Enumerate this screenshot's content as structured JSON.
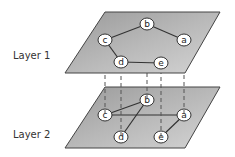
{
  "layers": [
    {
      "label": "Layer 1",
      "nodes": [
        {
          "id": "a",
          "label": "a",
          "x": 184,
          "y": 40
        },
        {
          "id": "b",
          "label": "b",
          "x": 147,
          "y": 24
        },
        {
          "id": "c",
          "label": "c",
          "x": 105,
          "y": 40
        },
        {
          "id": "d",
          "label": "d",
          "x": 121,
          "y": 62
        },
        {
          "id": "e",
          "label": "e",
          "x": 161,
          "y": 63
        }
      ],
      "edges": [
        [
          "c",
          "b"
        ],
        [
          "b",
          "a"
        ],
        [
          "c",
          "d"
        ],
        [
          "d",
          "e"
        ]
      ]
    },
    {
      "label": "Layer 2",
      "nodes": [
        {
          "id": "a",
          "label": "a",
          "x": 184,
          "y": 115
        },
        {
          "id": "b",
          "label": "b",
          "x": 147,
          "y": 100
        },
        {
          "id": "c",
          "label": "c",
          "x": 105,
          "y": 115
        },
        {
          "id": "d",
          "label": "d",
          "x": 121,
          "y": 137
        },
        {
          "id": "e",
          "label": "e",
          "x": 161,
          "y": 137
        }
      ],
      "edges": [
        [
          "c",
          "b"
        ],
        [
          "b",
          "d"
        ],
        [
          "c",
          "a"
        ],
        [
          "a",
          "e"
        ]
      ]
    }
  ],
  "interlayer_links": [
    "c",
    "d",
    "b",
    "e",
    "a"
  ],
  "colors": {
    "plane_fill": "#a8a8a8",
    "plane_stroke": "#444444",
    "node_fill": "#ffffff",
    "edge": "#333333"
  }
}
